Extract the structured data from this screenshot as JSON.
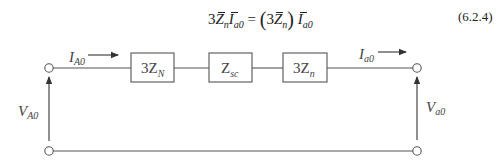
{
  "equation": {
    "lhs_coeff": "3",
    "lhs_Z": "Z",
    "lhs_Z_sub": "n",
    "lhs_I": "I",
    "lhs_I_sub": "a0",
    "equals": " = ",
    "rhs_open": "(",
    "rhs_coeff": "3",
    "rhs_Z": "Z",
    "rhs_Z_sub": "n",
    "rhs_close": ")",
    "rhs_I": "I",
    "rhs_I_sub": "a0",
    "number": "(6.2.4)"
  },
  "diagram": {
    "stroke_color": "#555555",
    "left_current": {
      "main": "I",
      "sub": "A0"
    },
    "right_current": {
      "main": "I",
      "sub": "a0"
    },
    "left_voltage": {
      "main": "V",
      "sub": "A0"
    },
    "right_voltage": {
      "main": "V",
      "sub": "a0"
    },
    "impedances": [
      {
        "main": "3Z",
        "sub": "N"
      },
      {
        "main": "Z",
        "sub": "sc"
      },
      {
        "main": "3Z",
        "sub": "n"
      }
    ]
  }
}
